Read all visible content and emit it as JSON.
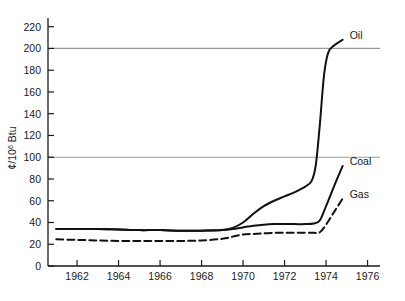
{
  "chart_data": {
    "type": "line",
    "title": "",
    "subtitle": "",
    "xlabel": "",
    "ylabel": "¢/10⁶ Btu",
    "ylabel_parts": {
      "prefix": "¢/10",
      "exponent": "6",
      "suffix": " Btu"
    },
    "xlim": [
      1960.6,
      1976.6
    ],
    "ylim": [
      0,
      228
    ],
    "yticks": [
      0,
      20,
      40,
      60,
      80,
      100,
      120,
      140,
      160,
      180,
      200,
      220
    ],
    "ytick_labels": [
      "0",
      "20",
      "40",
      "60",
      "80",
      "100",
      "120",
      "140",
      "160",
      "180",
      "200",
      "220"
    ],
    "xticks": [
      1962,
      1964,
      1966,
      1968,
      1970,
      1972,
      1974,
      1976
    ],
    "xtick_labels": [
      "1962",
      "1964",
      "1966",
      "1968",
      "1970",
      "1972",
      "1974",
      "1976"
    ],
    "gridlines_y": [
      100,
      200
    ],
    "grid": "horizontal-at-100-and-200",
    "legend_position": "right-end-of-each-line",
    "series": [
      {
        "name": "Oil",
        "label": "Oil",
        "style": "solid",
        "color": "#111111",
        "x": [
          1961.0,
          1962.0,
          1963.0,
          1964.0,
          1965.0,
          1966.0,
          1967.0,
          1968.0,
          1969.0,
          1969.5,
          1970.0,
          1970.5,
          1971.0,
          1971.5,
          1972.0,
          1972.5,
          1973.0,
          1973.3,
          1973.5,
          1973.7,
          1973.9,
          1974.1,
          1974.4,
          1974.8
        ],
        "y": [
          34,
          34,
          34,
          33.5,
          33,
          33,
          32.5,
          32.5,
          33,
          35,
          40,
          48,
          55,
          60,
          64,
          68,
          73,
          78,
          92,
          130,
          175,
          196,
          203,
          208
        ]
      },
      {
        "name": "Coal",
        "label": "Coal",
        "style": "solid",
        "color": "#111111",
        "x": [
          1961.0,
          1962.0,
          1963.0,
          1964.0,
          1965.0,
          1966.0,
          1967.0,
          1968.0,
          1969.0,
          1969.5,
          1970.0,
          1970.5,
          1971.0,
          1971.5,
          1972.0,
          1972.5,
          1973.0,
          1973.4,
          1973.7,
          1974.0,
          1974.4,
          1974.8
        ],
        "y": [
          34,
          34,
          34,
          33.5,
          33,
          33,
          32.5,
          32.5,
          33,
          34,
          35.5,
          37,
          38,
          38.5,
          38.5,
          38.5,
          38.5,
          39,
          42,
          55,
          74,
          92
        ]
      },
      {
        "name": "Gas",
        "label": "Gas",
        "style": "dashed",
        "color": "#111111",
        "x": [
          1961.0,
          1962.0,
          1963.0,
          1964.0,
          1965.0,
          1966.0,
          1967.0,
          1968.0,
          1969.0,
          1969.5,
          1970.0,
          1970.5,
          1971.0,
          1971.5,
          1972.0,
          1972.5,
          1973.0,
          1973.4,
          1973.7,
          1974.0,
          1974.4,
          1974.8
        ],
        "y": [
          24.5,
          24,
          23.5,
          23,
          23,
          23,
          23,
          23.5,
          25,
          27,
          29,
          29.5,
          30,
          30.5,
          30.5,
          30.5,
          30.5,
          30.5,
          31,
          38,
          50,
          62
        ]
      }
    ],
    "axis_color": "#1a1a1a",
    "grid_color": "#9a9a9a",
    "background": "#ffffff"
  }
}
